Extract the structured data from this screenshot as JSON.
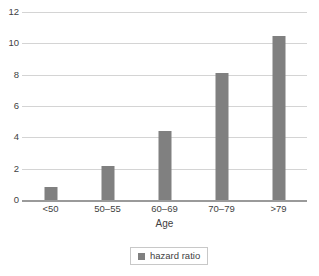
{
  "chart_data": {
    "type": "bar",
    "title": "",
    "subtitle": "",
    "categories": [
      "<50",
      "50–55",
      "60–69",
      "70–79",
      ">79"
    ],
    "series": [
      {
        "name": "hazard ratio",
        "values": [
          0.85,
          2.15,
          4.4,
          8.1,
          10.5
        ],
        "color": "#808080"
      }
    ],
    "xlabel": "Age",
    "ylabel": "",
    "ylim": [
      0,
      12
    ],
    "yticks": [
      0,
      2,
      4,
      6,
      8,
      10,
      12
    ],
    "ytick_labels": [
      "0",
      "2",
      "4",
      "6",
      "8",
      "10",
      "12"
    ],
    "grid": true,
    "grid_axis": "y",
    "grid_color": "#d4d4d4",
    "axis_line_color": "#9a9a9a",
    "background": "#ffffff",
    "legend": {
      "position": "bottom",
      "bordered": true,
      "entries": [
        {
          "label": "hazard ratio",
          "color": "#808080",
          "marker": "square"
        }
      ]
    }
  }
}
